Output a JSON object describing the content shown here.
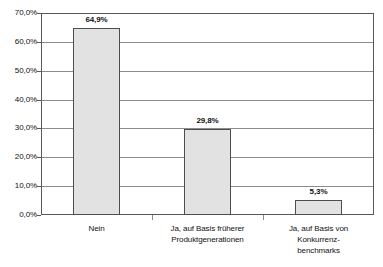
{
  "chart_data": {
    "type": "bar",
    "title": "",
    "xlabel": "",
    "ylabel": "",
    "categories": [
      "Nein",
      "Ja, auf Basis früherer Produktgenerationen",
      "Ja, auf Basis von Konkurrenz-benchmarks"
    ],
    "category_lines": [
      [
        "Nein"
      ],
      [
        "Ja, auf Basis früherer",
        "Produktgenerationen"
      ],
      [
        "Ja, auf Basis von",
        "Konkurrenz-",
        "benchmarks"
      ]
    ],
    "values": [
      64.9,
      29.8,
      5.3
    ],
    "value_labels": [
      "64,9%",
      "29,8%",
      "5,3%"
    ],
    "ylim": [
      0,
      70
    ],
    "ytick_values": [
      0,
      10,
      20,
      30,
      40,
      50,
      60,
      70
    ],
    "ytick_labels": [
      "0,0%",
      "10,0%",
      "20,0%",
      "30,0%",
      "40,0%",
      "50,0%",
      "60,0%",
      "70,0%"
    ],
    "grid": true,
    "legend": false,
    "bar_fill_color": "#e2e2e2",
    "bar_border_color": "#4d4d4d",
    "gridline_color": "#8c8c8c",
    "axis_color": "#595959"
  }
}
